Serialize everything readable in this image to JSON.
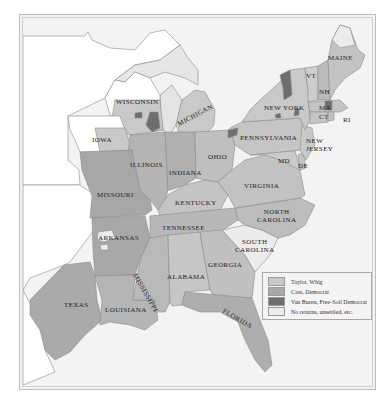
{
  "map": {
    "subject": "1848 U.S. presidential election results by county",
    "colors": {
      "taylor_whig": "#c8c8c8",
      "cass_democrat": "#a9a9a9",
      "van_buren_free_soil": "#6e6e6e",
      "no_returns": "#ececec",
      "water": "#f3f3f3",
      "territory": "#ffffff"
    },
    "states": {
      "maine": "MAINE",
      "vt": "VT",
      "nh": "NH",
      "ma": "MA",
      "ct": "CT",
      "ri": "RI",
      "new_york": "NEW YORK",
      "new_jersey_1": "NEW",
      "new_jersey_2": "JERSEY",
      "pennsylvania": "PENNSYLVANIA",
      "md": "MD",
      "de": "DE",
      "wisconsin": "WISCONSIN",
      "michigan": "MICHIGAN",
      "iowa": "IOWA",
      "illinois": "ILLINOIS",
      "indiana": "INDIANA",
      "ohio": "OHIO",
      "virginia": "VIRGINIA",
      "missouri": "MISSOURI",
      "kentucky": "KENTUCKY",
      "north_carolina_1": "NORTH",
      "north_carolina_2": "CAROLINA",
      "arkansas": "ARKANSAS",
      "tennessee": "TENNESSEE",
      "south_carolina_1": "SOUTH",
      "south_carolina_2": "CAROLINA",
      "mississippi": "MISSISSIPPI",
      "alabama": "ALABAMA",
      "georgia": "GEORGIA",
      "texas": "TEXAS",
      "louisiana": "LOUISIANA",
      "florida": "FLORIDA"
    }
  },
  "legend": {
    "items": [
      {
        "label": "Taylor, Whig",
        "color": "#c8c8c8"
      },
      {
        "label": "Cass, Democrat",
        "color": "#a9a9a9"
      },
      {
        "label": "Van Buren, Free-Soil Democrat",
        "color": "#6e6e6e"
      },
      {
        "label": "No returns, unsettled, etc.",
        "color": "#ececec"
      }
    ]
  }
}
